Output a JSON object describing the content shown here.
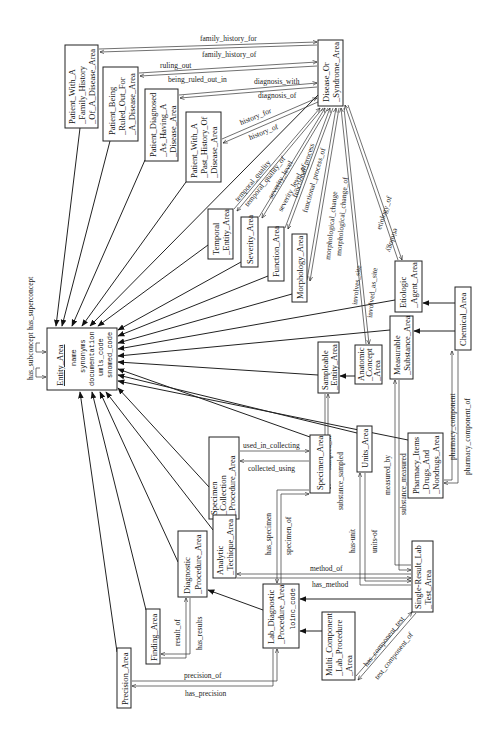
{
  "diagram": {
    "orientation": "rotated-90-ccw",
    "nodes": {
      "entity": {
        "title": "Entity_Area",
        "attributes": [
          "name",
          "synonyms",
          "documentation",
          "umls_code",
          "snomed_code"
        ]
      },
      "family_history": {
        "lines": [
          "Patient_With_A",
          "_Family_History",
          "_Of_A_Disease_Area"
        ]
      },
      "ruled_out": {
        "lines": [
          "Patient_Being",
          "_Ruled_Out_For",
          "_A_Disease_Area"
        ]
      },
      "diagnosed": {
        "lines": [
          "Patient_Diagnosed",
          "_As_Having_A",
          "_Disease_Area"
        ]
      },
      "past_history": {
        "lines": [
          "Patient_With_A",
          "_Past_History_Of",
          "_Disease_Area"
        ]
      },
      "disease": {
        "lines": [
          "Disease_Or",
          "_Syndrome_Area"
        ]
      },
      "temporal": {
        "lines": [
          "Temporal",
          "_Entity_Area"
        ]
      },
      "severity": {
        "lines": [
          "Severity_Area"
        ]
      },
      "function": {
        "lines": [
          "Function_Area"
        ]
      },
      "morphology": {
        "lines": [
          "Morphology_Area"
        ]
      },
      "etiologic": {
        "lines": [
          "Etiologic",
          "_Agent_Area"
        ]
      },
      "chemical": {
        "lines": [
          "Chemical_Area"
        ]
      },
      "measurable": {
        "lines": [
          "Measurable",
          "_Substance_Area"
        ]
      },
      "anatomic": {
        "lines": [
          "Anatomic",
          "_Concept",
          "_Area"
        ]
      },
      "sampleable": {
        "lines": [
          "Sampleable",
          "_Entity_Area"
        ]
      },
      "units": {
        "lines": [
          "Units_Area"
        ]
      },
      "specimen": {
        "lines": [
          "Specimen_Area"
        ]
      },
      "specimen_collection": {
        "lines": [
          "Specimen",
          "_Collection",
          "_Procedure_Area"
        ]
      },
      "pharmacy": {
        "lines": [
          "Pharmacy_Items",
          "_Drugs_And",
          "_Nondrugs_Area"
        ]
      },
      "analytic": {
        "lines": [
          "Analytic",
          "_Techique_Area"
        ]
      },
      "diagnostic": {
        "lines": [
          "Diagnostic",
          "_Procedure_Area"
        ]
      },
      "lab_diagnostic": {
        "lines": [
          "Lab_Diagnostic",
          "_Procedure_Area"
        ],
        "attribute": "loinc_code"
      },
      "multi_component": {
        "lines": [
          "Multi_Component",
          "_Lab_Procedure",
          "_Area"
        ]
      },
      "single_result": {
        "lines": [
          "Single-Result_Lab",
          "_Test_Area"
        ]
      },
      "finding": {
        "lines": [
          "Finding_Area"
        ]
      },
      "precision": {
        "lines": [
          "Precision_Area"
        ]
      }
    },
    "relations": {
      "has_subconcept": "has_subconcept",
      "has_superconcept": "has_superconcept",
      "family_history_for": "family_history_for",
      "family_history_of": "family_history_of",
      "ruling_out": "ruling_out",
      "being_ruled_out_in": "being_ruled_out_in",
      "diagnosis_with": "diagnosis_with",
      "diagnosis_of": "diagnosis_of",
      "history_for": "history_for",
      "history_of": "history_of",
      "temporal_quality": "temporal_quality",
      "temporal_quality_of": "temporal_quality_of",
      "severity_level": "severity_level",
      "severity_level_of": "severity_level_of",
      "functional_process": "functional_process",
      "functional_process_of": "functional_process_of",
      "morphological_change": "morphological_change",
      "morphological_change_of": "morphological_change_of",
      "involves_site": "involves_site",
      "involved_as_site": "involved_as_site",
      "etiology_of": "etiology_of",
      "etiology": "etiology",
      "used_in_collecting": "used_in_collecting",
      "collected_using": "collected_using",
      "sampled_in": "sampled_in",
      "substance_sampled": "substance_sampled",
      "measured_by": "measured_by",
      "substance_measured": "substance_measured",
      "pharmacy_component": "pharmacy_component",
      "pharmacy_component_of": "pharmacy_component_of",
      "has_specimen": "has_specimen",
      "specimen_of": "specimen_of",
      "has_unit": "has-unit",
      "units_of": "units-of",
      "method_of": "method_of",
      "has_method": "has_method",
      "result_of": "result_of",
      "has_results": "has_results",
      "precision_of": "precision_of",
      "has_precision": "has_precision",
      "has_component_test": "has_component_test",
      "test_component_of": "test_component_of"
    }
  }
}
